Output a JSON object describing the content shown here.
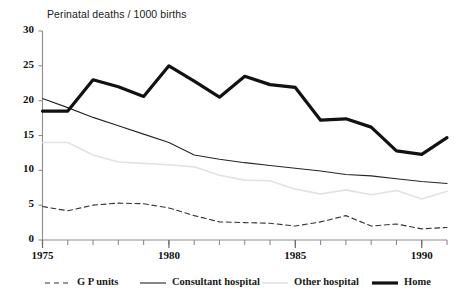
{
  "chart_data": {
    "type": "line",
    "title": "Perinatal deaths / 1000 births",
    "xlabel": "",
    "ylabel": "",
    "xlim": [
      1975,
      1991
    ],
    "ylim": [
      0,
      30
    ],
    "yticks": [
      0,
      5,
      10,
      15,
      20,
      25,
      30
    ],
    "xticks": [
      1975,
      1976,
      1977,
      1978,
      1979,
      1980,
      1981,
      1982,
      1983,
      1984,
      1985,
      1986,
      1987,
      1988,
      1989,
      1990,
      1991
    ],
    "xtick_labels_shown": [
      "1975",
      "1980",
      "1985",
      "1990"
    ],
    "grid": false,
    "legend_position": "bottom",
    "x": [
      1975,
      1976,
      1977,
      1978,
      1979,
      1980,
      1981,
      1982,
      1983,
      1984,
      1985,
      1986,
      1987,
      1988,
      1989,
      1990,
      1991
    ],
    "series": [
      {
        "name": "G P units",
        "style": "dashed",
        "color": "#333333",
        "width": 1.1,
        "values": [
          4.8,
          4.2,
          5.0,
          5.3,
          5.2,
          4.6,
          3.5,
          2.6,
          2.5,
          2.4,
          2.0,
          2.6,
          3.5,
          2.0,
          2.3,
          1.6,
          1.8
        ]
      },
      {
        "name": "Consultant hospital",
        "style": "solid",
        "color": "#262626",
        "width": 1.1,
        "values": [
          20.3,
          19.0,
          17.6,
          16.4,
          15.2,
          14.0,
          12.2,
          11.6,
          11.1,
          10.7,
          10.3,
          9.9,
          9.4,
          9.2,
          8.8,
          8.4,
          8.1
        ]
      },
      {
        "name": "Other hospital",
        "style": "solid",
        "color": "#e2e2e2",
        "width": 1.6,
        "values": [
          14.0,
          14.0,
          12.2,
          11.2,
          11.0,
          10.8,
          10.5,
          9.3,
          8.6,
          8.5,
          7.3,
          6.6,
          7.2,
          6.5,
          7.1,
          5.9,
          7.0
        ]
      },
      {
        "name": "Home",
        "style": "solid",
        "color": "#111111",
        "width": 3.2,
        "values": [
          18.5,
          18.5,
          23.0,
          22.0,
          20.6,
          25.0,
          22.8,
          20.5,
          23.5,
          22.3,
          21.9,
          17.2,
          17.4,
          16.2,
          12.8,
          12.3,
          14.7
        ]
      }
    ]
  },
  "legend": {
    "items": [
      {
        "label": "G P units",
        "swatch": "dashed-line-swatch"
      },
      {
        "label": "Consultant hospital",
        "swatch": "thin-line-swatch"
      },
      {
        "label": "Other hospital",
        "swatch": "light-line-swatch"
      },
      {
        "label": "Home",
        "swatch": "thick-line-swatch"
      }
    ]
  },
  "axis": {
    "y_labels": [
      "30",
      "25",
      "20",
      "15",
      "10",
      "5",
      "0"
    ],
    "x_labels": [
      "1975",
      "1980",
      "1985",
      "1990"
    ]
  }
}
